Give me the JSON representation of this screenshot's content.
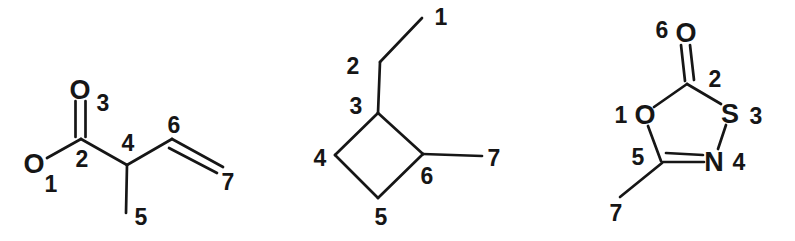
{
  "page": {
    "background_color": "#ffffff",
    "ink_color": "#161616",
    "bond_stroke_width": 2.7
  },
  "figure": {
    "width": 795,
    "height": 241,
    "description_labels_only": "three numbered chemical structure drawings",
    "structures": [
      {
        "id": "molecule-left",
        "labels": [
          {
            "text": "O",
            "type": "atom",
            "x": 80,
            "y": 90
          },
          {
            "text": "O",
            "type": "atom",
            "x": 34,
            "y": 164
          },
          {
            "text": "3",
            "type": "number",
            "x": 103,
            "y": 103
          },
          {
            "text": "2",
            "type": "number",
            "x": 82,
            "y": 159
          },
          {
            "text": "1",
            "type": "number",
            "x": 51,
            "y": 184
          },
          {
            "text": "4",
            "type": "number",
            "x": 128,
            "y": 143
          },
          {
            "text": "6",
            "type": "number",
            "x": 174,
            "y": 125
          },
          {
            "text": "7",
            "type": "number",
            "x": 228,
            "y": 182
          },
          {
            "text": "5",
            "type": "number",
            "x": 141,
            "y": 217
          }
        ],
        "bonds": [
          {
            "x1": 75.5,
            "y1": 101,
            "x2": 75.5,
            "y2": 137
          },
          {
            "x1": 85.5,
            "y1": 101,
            "x2": 85.5,
            "y2": 137
          },
          {
            "x1": 81,
            "y1": 139,
            "x2": 47,
            "y2": 158
          },
          {
            "x1": 81,
            "y1": 139,
            "x2": 127,
            "y2": 165
          },
          {
            "x1": 127,
            "y1": 165,
            "x2": 172,
            "y2": 139
          },
          {
            "x1": 172,
            "y1": 139,
            "x2": 223,
            "y2": 167
          },
          {
            "x1": 169,
            "y1": 148,
            "x2": 217,
            "y2": 173
          },
          {
            "x1": 127,
            "y1": 165,
            "x2": 126,
            "y2": 213
          }
        ]
      },
      {
        "id": "molecule-middle",
        "labels": [
          {
            "text": "1",
            "type": "number",
            "x": 441,
            "y": 17
          },
          {
            "text": "2",
            "type": "number",
            "x": 353,
            "y": 66
          },
          {
            "text": "3",
            "type": "number",
            "x": 356,
            "y": 106
          },
          {
            "text": "4",
            "type": "number",
            "x": 320,
            "y": 158
          },
          {
            "text": "5",
            "type": "number",
            "x": 381,
            "y": 217
          },
          {
            "text": "6",
            "type": "number",
            "x": 427,
            "y": 176
          },
          {
            "text": "7",
            "type": "number",
            "x": 494,
            "y": 158
          }
        ],
        "bonds": [
          {
            "x1": 378,
            "y1": 113,
            "x2": 335,
            "y2": 155
          },
          {
            "x1": 335,
            "y1": 155,
            "x2": 378,
            "y2": 198
          },
          {
            "x1": 378,
            "y1": 198,
            "x2": 423,
            "y2": 154
          },
          {
            "x1": 423,
            "y1": 154,
            "x2": 378,
            "y2": 113
          },
          {
            "x1": 378,
            "y1": 113,
            "x2": 380,
            "y2": 62
          },
          {
            "x1": 380,
            "y1": 62,
            "x2": 422,
            "y2": 18
          },
          {
            "x1": 423,
            "y1": 154,
            "x2": 482,
            "y2": 156
          }
        ]
      },
      {
        "id": "molecule-right",
        "labels": [
          {
            "text": "O",
            "type": "atom",
            "x": 686,
            "y": 33
          },
          {
            "text": "O",
            "type": "atom",
            "x": 645,
            "y": 115
          },
          {
            "text": "S",
            "type": "atom",
            "x": 730,
            "y": 114
          },
          {
            "text": "N",
            "type": "atom",
            "x": 714,
            "y": 162
          },
          {
            "text": "6",
            "type": "number",
            "x": 662,
            "y": 30
          },
          {
            "text": "2",
            "type": "number",
            "x": 715,
            "y": 79
          },
          {
            "text": "1",
            "type": "number",
            "x": 621,
            "y": 115
          },
          {
            "text": "3",
            "type": "number",
            "x": 756,
            "y": 116
          },
          {
            "text": "4",
            "type": "number",
            "x": 739,
            "y": 162
          },
          {
            "text": "5",
            "type": "number",
            "x": 638,
            "y": 157
          },
          {
            "text": "7",
            "type": "number",
            "x": 616,
            "y": 213
          }
        ],
        "bonds": [
          {
            "x1": 681,
            "y1": 45,
            "x2": 685,
            "y2": 81
          },
          {
            "x1": 690,
            "y1": 45,
            "x2": 694,
            "y2": 80
          },
          {
            "x1": 687,
            "y1": 84,
            "x2": 654,
            "y2": 107
          },
          {
            "x1": 687,
            "y1": 84,
            "x2": 721,
            "y2": 104
          },
          {
            "x1": 648,
            "y1": 126,
            "x2": 661,
            "y2": 161
          },
          {
            "x1": 726,
            "y1": 125,
            "x2": 718,
            "y2": 149
          },
          {
            "x1": 663,
            "y1": 162,
            "x2": 704,
            "y2": 162
          },
          {
            "x1": 666,
            "y1": 153,
            "x2": 703,
            "y2": 155
          },
          {
            "x1": 662,
            "y1": 163,
            "x2": 620,
            "y2": 197
          }
        ]
      }
    ]
  }
}
